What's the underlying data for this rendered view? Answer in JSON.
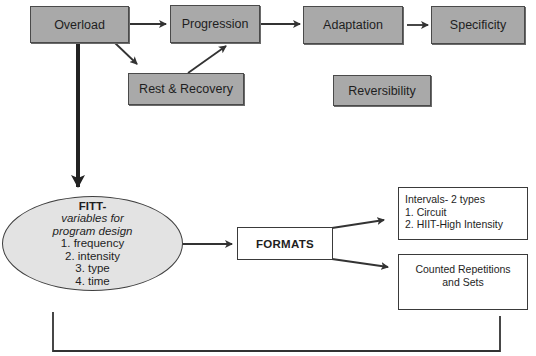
{
  "diagram": {
    "principles": {
      "overload": "Overload",
      "progression": "Progression",
      "adaptation": "Adaptation",
      "specificity": "Specificity",
      "rest_recovery": "Rest & Recovery",
      "reversibility": "Reversibility"
    },
    "fitt": {
      "title": "FITT-",
      "subtitle_line1": "variables for",
      "subtitle_line2": "program design",
      "items": [
        "1.  frequency",
        "2.  intensity",
        "3.  type",
        "4.  time"
      ]
    },
    "formats": {
      "label": "FORMATS"
    },
    "intervals": {
      "title": "Intervals- 2 types",
      "items": [
        "1.  Circuit",
        "2. HIIT-High Intensity"
      ]
    },
    "counted": {
      "line1": "Counted Repetitions",
      "line2": "and Sets"
    },
    "colors": {
      "grey_box_fill": "#a9a9a9",
      "ellipse_fill": "#e3e3e3",
      "stroke": "#333333"
    },
    "edges": [
      {
        "from": "Overload",
        "to": "Progression"
      },
      {
        "from": "Overload",
        "to": "Rest & Recovery"
      },
      {
        "from": "Rest & Recovery",
        "to": "Progression"
      },
      {
        "from": "Progression",
        "to": "Adaptation"
      },
      {
        "from": "Adaptation",
        "to": "Specificity"
      },
      {
        "from": "Overload",
        "to": "FITT"
      },
      {
        "from": "FITT",
        "to": "FORMATS"
      },
      {
        "from": "FORMATS",
        "to": "Intervals"
      },
      {
        "from": "FORMATS",
        "to": "Counted Repetitions and Sets"
      }
    ]
  }
}
